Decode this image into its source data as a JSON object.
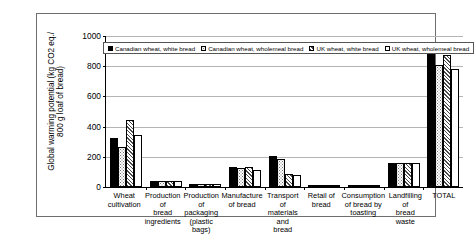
{
  "chart_data": {
    "type": "bar",
    "title": "",
    "xlabel": "",
    "ylabel": "Global warming potential (kg CO2 eq./\n800 g loaf of bread)",
    "ylim": [
      0,
      1000
    ],
    "yticks": [
      0,
      200,
      400,
      600,
      800,
      1000
    ],
    "ytick_labels": [
      "0",
      "200",
      "400",
      "600",
      "800",
      "1000"
    ],
    "grid": true,
    "legend_position": "top-left-inside",
    "categories": [
      "Wheat\ncultivation",
      "Production of\nbread\ningredients",
      "Production of\npackaging\n(plastic bags)",
      "Manufacture\nof bread",
      "Transport of\nmaterials and\nbread",
      "Retail of\nbread",
      "Consumption\nof bread by\ntoasting",
      "Landfilling of\nbread waste",
      "TOTAL"
    ],
    "series": [
      {
        "name": "Canadian wheat, white bread",
        "fill": "black",
        "values": [
          325,
          42,
          20,
          130,
          205,
          10,
          12,
          155,
          925
        ]
      },
      {
        "name": "Canadian wheat, wholemeal bread",
        "fill": "dots",
        "values": [
          260,
          42,
          20,
          125,
          185,
          10,
          12,
          155,
          800
        ]
      },
      {
        "name": "UK wheat, white bread",
        "fill": "hatch",
        "values": [
          440,
          42,
          20,
          130,
          85,
          10,
          12,
          155,
          870
        ]
      },
      {
        "name": "UK wheat, wholemeal bread",
        "fill": "white",
        "values": [
          340,
          42,
          20,
          115,
          80,
          10,
          12,
          155,
          775
        ]
      }
    ]
  },
  "colors": {
    "axis": "#000000",
    "gridline": "#b5b5b5",
    "frame": "#6e6e6e",
    "background": "#ffffff"
  }
}
